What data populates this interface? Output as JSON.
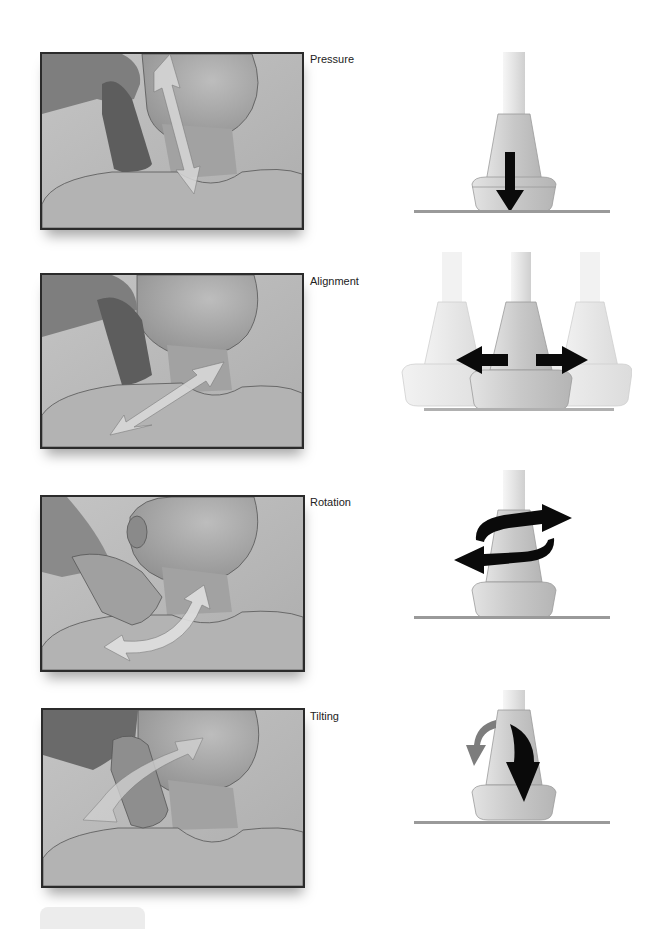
{
  "figure": {
    "panels": [
      {
        "id": "pressure",
        "label": "Pressure",
        "photo_arrow": "bidirectional vertical arrow along neck",
        "probe_motion": "downward arrow into skin surface"
      },
      {
        "id": "alignment",
        "label": "Alignment",
        "photo_arrow": "diagonal arrow sliding along neck toward shoulder",
        "probe_motion": "left and right arrows showing probe sliding sideways"
      },
      {
        "id": "rotation",
        "label": "Rotation",
        "photo_arrow": "curved arc arrow around probe contact point",
        "probe_motion": "circular arrows around probe axis"
      },
      {
        "id": "tilting",
        "label": "Tilting",
        "photo_arrow": "curved double-headed arrow tilting probe",
        "probe_motion": "curved arrows rocking probe forward and back"
      }
    ],
    "caption": {
      "visible": "partially cut off at bottom edge",
      "text": ""
    }
  },
  "colors": {
    "panel_background": "#b9b9b9",
    "panel_border": "#2b2b2b",
    "skin": "#a8a8a8",
    "probe_body": "#d6d6d6",
    "probe_cable": "#ececec",
    "surface_line": "#9a9a9a",
    "arrow_dark": "#0a0a0a",
    "arrow_light": "#e4e4e4",
    "arrow_gray": "#7d7d7d"
  }
}
